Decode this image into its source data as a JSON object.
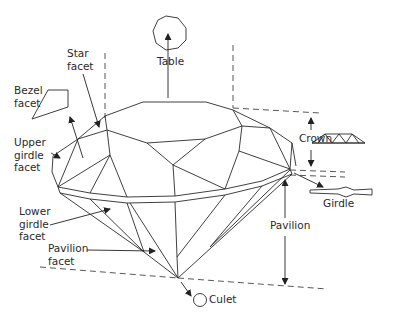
{
  "diagram": {
    "colors": {
      "line": "#2a2a2a",
      "background": "#ffffff"
    },
    "labels": {
      "table": "Table",
      "star_facet": [
        "Star",
        "facet"
      ],
      "bezel_facet": [
        "Bezel",
        "facet"
      ],
      "upper_girdle_facet": [
        "Upper",
        "girdle",
        "facet"
      ],
      "crown": "Crown",
      "girdle": "Girdle",
      "lower_girdle_facet": [
        "Lower",
        "girdle",
        "facet"
      ],
      "pavilion_facet": [
        "Pavilion",
        "facet"
      ],
      "pavilion": "Pavilion",
      "culet": "Culet"
    }
  }
}
